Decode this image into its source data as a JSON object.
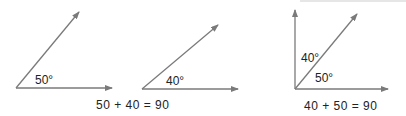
{
  "figures": [
    {
      "name": "angle-a",
      "label": "50°",
      "vertex": [
        16,
        88
      ],
      "rays": [
        [
          112,
          88
        ],
        [
          79,
          12
        ]
      ]
    },
    {
      "name": "angle-b",
      "label": "40°",
      "vertex": [
        142,
        89
      ],
      "rays": [
        [
          238,
          89
        ],
        [
          218,
          25
        ]
      ]
    },
    {
      "name": "combined-right-angle",
      "labels": {
        "upper": "40°",
        "lower": "50°"
      },
      "vertex": [
        295,
        89
      ],
      "rays": [
        [
          388,
          89
        ],
        [
          295,
          10
        ],
        [
          357,
          14
        ]
      ]
    }
  ],
  "equations": {
    "left": "50 + 40 = 90",
    "right": "40 + 50 = 90"
  },
  "colors": {
    "line": "#7a7a7a",
    "text": "#222222",
    "topline": "#e6e6e6"
  }
}
